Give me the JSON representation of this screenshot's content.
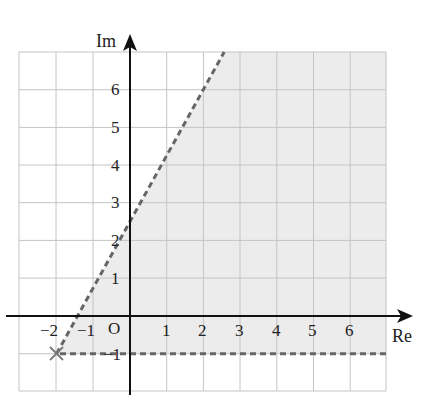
{
  "diagram": {
    "type": "argand-diagram-region",
    "axes": {
      "x_label": "Re",
      "y_label": "Im",
      "origin_label": "O",
      "x_range": [
        -3,
        7
      ],
      "y_range": [
        -2,
        7
      ],
      "x_ticks": [
        "−2",
        "−1",
        "1",
        "2",
        "3",
        "4",
        "5",
        "6"
      ],
      "y_ticks": [
        "1",
        "2",
        "3",
        "4",
        "5",
        "6",
        "−1"
      ]
    },
    "boundaries": [
      {
        "name": "half-line",
        "style": "dashed",
        "from": [
          -2,
          -1
        ],
        "through": [
          2,
          6
        ],
        "to": [
          2.57,
          7
        ]
      },
      {
        "name": "horizontal-half-line",
        "style": "dashed",
        "from": [
          -2,
          -1
        ],
        "to": [
          7,
          -1
        ]
      }
    ],
    "vertex": {
      "point": [
        -2,
        -1
      ],
      "marker": "cross"
    },
    "shaded_region": [
      [
        -2,
        -1
      ],
      [
        2.57,
        7
      ],
      [
        7,
        7
      ],
      [
        7,
        -1
      ]
    ],
    "colors": {
      "grid": "#bdbdbd",
      "axis": "#111111",
      "dashed": "#666666",
      "shade": "#ececec"
    }
  }
}
